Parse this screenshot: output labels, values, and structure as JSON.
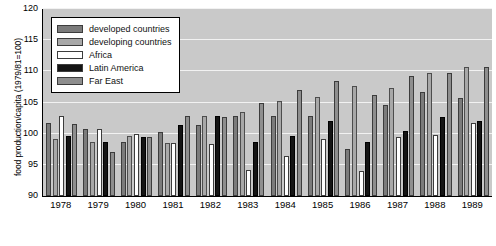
{
  "chart_data": {
    "type": "bar",
    "title": "",
    "xlabel": "",
    "ylabel": "food production/capita (1979/81=100)",
    "ylim": [
      90,
      120
    ],
    "yticks": [
      90,
      95,
      100,
      105,
      110,
      115,
      120
    ],
    "grid": true,
    "legend_position": "upper-left",
    "categories": [
      "1978",
      "1979",
      "1980",
      "1981",
      "1982",
      "1983",
      "1984",
      "1985",
      "1986",
      "1987",
      "1988",
      "1989"
    ],
    "series": [
      {
        "name": "developed countries",
        "color": "#7b7b7b",
        "values": [
          101.7,
          100.7,
          98.7,
          100.2,
          101.4,
          102.8,
          102.8,
          102.8,
          97.6,
          104.6,
          106.7,
          105.7
        ]
      },
      {
        "name": "developing countries",
        "color": "#a8a8a8",
        "values": [
          99.2,
          98.6,
          99.6,
          98.5,
          102.9,
          103.4,
          105.2,
          105.9,
          107.7,
          107.3,
          109.7,
          110.7
        ]
      },
      {
        "name": "Africa",
        "color": "#ffffff",
        "values": [
          102.8,
          100.7,
          100.0,
          98.5,
          98.4,
          94.2,
          96.4,
          99.1,
          94.0,
          99.4,
          99.8,
          101.7
        ]
      },
      {
        "name": "Latin America",
        "color": "#141414",
        "values": [
          99.7,
          98.7,
          99.5,
          101.4,
          102.9,
          98.6,
          99.7,
          102.0,
          98.6,
          100.4,
          102.7,
          102.0
        ]
      },
      {
        "name": "Far East",
        "color": "#8e8e8e",
        "values": [
          101.5,
          97.1,
          99.5,
          102.9,
          102.7,
          105.0,
          107.0,
          108.4,
          106.2,
          109.2,
          109.7,
          110.7
        ]
      }
    ]
  },
  "legend": {
    "items": [
      {
        "label": "developed countries",
        "color": "#7b7b7b"
      },
      {
        "label": "developing countries",
        "color": "#a8a8a8"
      },
      {
        "label": "Africa",
        "color": "#ffffff"
      },
      {
        "label": "Latin America",
        "color": "#141414"
      },
      {
        "label": "Far East",
        "color": "#8e8e8e"
      }
    ]
  }
}
